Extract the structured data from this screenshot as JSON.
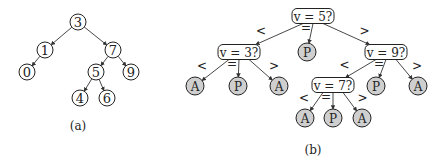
{
  "figure_a": {
    "caption": "(a)",
    "nodes": [
      {
        "id": "n3",
        "label": "3",
        "x": 78,
        "y": 22
      },
      {
        "id": "n1",
        "label": "1",
        "x": 45,
        "y": 50
      },
      {
        "id": "n7",
        "label": "7",
        "x": 113,
        "y": 50
      },
      {
        "id": "n0",
        "label": "0",
        "x": 27,
        "y": 72
      },
      {
        "id": "n5",
        "label": "5",
        "x": 96,
        "y": 72
      },
      {
        "id": "n9",
        "label": "9",
        "x": 131,
        "y": 72
      },
      {
        "id": "n4",
        "label": "4",
        "x": 80,
        "y": 98
      },
      {
        "id": "n6",
        "label": "6",
        "x": 107,
        "y": 98
      }
    ],
    "edges": [
      [
        "n3",
        "n1"
      ],
      [
        "n3",
        "n7"
      ],
      [
        "n1",
        "n0"
      ],
      [
        "n7",
        "n5"
      ],
      [
        "n7",
        "n9"
      ],
      [
        "n5",
        "n4"
      ],
      [
        "n5",
        "n6"
      ]
    ]
  },
  "figure_b": {
    "caption": "(b)",
    "questions": [
      {
        "id": "q5",
        "label": "v = 5?",
        "x": 313,
        "y": 16
      },
      {
        "id": "q3",
        "label": "v = 3?",
        "x": 239,
        "y": 52
      },
      {
        "id": "q9",
        "label": "v = 9?",
        "x": 386,
        "y": 52
      },
      {
        "id": "q7",
        "label": "v = 7?",
        "x": 333,
        "y": 85
      }
    ],
    "leaves": [
      {
        "id": "p5",
        "label": "P",
        "x": 307,
        "y": 52
      },
      {
        "id": "a31",
        "label": "A",
        "x": 195,
        "y": 86
      },
      {
        "id": "p3",
        "label": "P",
        "x": 238,
        "y": 86
      },
      {
        "id": "a32",
        "label": "A",
        "x": 279,
        "y": 86
      },
      {
        "id": "p9",
        "label": "P",
        "x": 376,
        "y": 86
      },
      {
        "id": "a9",
        "label": "A",
        "x": 418,
        "y": 86
      },
      {
        "id": "a71",
        "label": "A",
        "x": 305,
        "y": 118
      },
      {
        "id": "p7",
        "label": "P",
        "x": 333,
        "y": 118
      },
      {
        "id": "a72",
        "label": "A",
        "x": 362,
        "y": 118
      }
    ],
    "edge_labels": {
      "lt": "<",
      "eq": "=",
      "gt": ">"
    }
  }
}
